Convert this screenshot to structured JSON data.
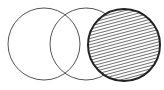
{
  "diagram": {
    "type": "venn-like three circles",
    "circles": [
      {
        "id": "left",
        "cx": 44,
        "cy": 44,
        "r": 36,
        "fill": "none",
        "stroke": "#555555",
        "stroke_width": 1,
        "hatched": false
      },
      {
        "id": "middle",
        "cx": 86,
        "cy": 44,
        "r": 36,
        "fill": "none",
        "stroke": "#555555",
        "stroke_width": 1,
        "hatched": false
      },
      {
        "id": "right",
        "cx": 124,
        "cy": 45,
        "r": 36,
        "fill": "hatch",
        "stroke": "#222222",
        "stroke_width": 2,
        "hatched": true
      }
    ],
    "colors": {
      "background": "#ffffff",
      "hatch": "#333333"
    }
  }
}
